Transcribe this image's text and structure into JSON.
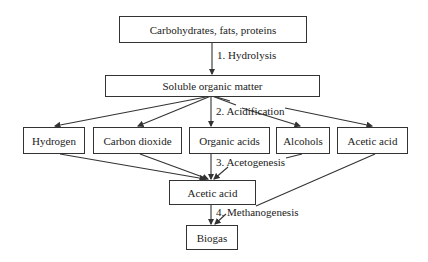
{
  "diagram": {
    "nodes": {
      "inputs": "Carbohydrates, fats, proteins",
      "soluble": "Soluble organic matter",
      "hydrogen": "Hydrogen",
      "co2": "Carbon dioxide",
      "organic_acids": "Organic acids",
      "alcohols": "Alcohols",
      "acetic_acid_1": "Acetic acid",
      "acetic_acid_2": "Acetic acid",
      "biogas": "Biogas"
    },
    "steps": {
      "s1": "1. Hydrolysis",
      "s2": "2. Acidification",
      "s3": "3. Acetogenesis",
      "s4": "4. Methanogenesis"
    }
  }
}
